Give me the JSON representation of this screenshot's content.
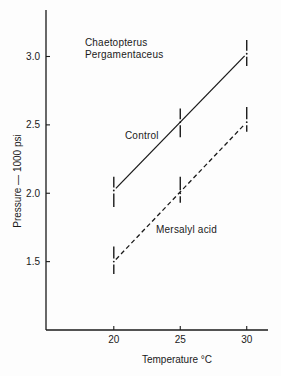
{
  "chart_data": {
    "type": "line",
    "title": "",
    "xlabel": "Temperature °C",
    "ylabel": "Pressure — 1000 psi",
    "x": [
      20,
      25,
      30
    ],
    "xticks": [
      20,
      25,
      30
    ],
    "xtick_labels": [
      "20",
      "25",
      "30"
    ],
    "yticks": [
      1.5,
      2.0,
      2.5,
      3.0
    ],
    "ytick_labels": [
      "1.5",
      "2.0",
      "2.5",
      "3.0"
    ],
    "xlim": [
      14.9,
      31.6
    ],
    "ylim": [
      1.0,
      3.34
    ],
    "grid": false,
    "legend": "none (series labeled directly on plot)",
    "series": [
      {
        "name": "Control",
        "line_style": "solid",
        "values": [
          2.02,
          2.52,
          3.02
        ],
        "error_low": [
          1.9,
          2.41,
          2.93
        ],
        "error_high": [
          2.12,
          2.62,
          3.12
        ]
      },
      {
        "name": "Mersalyl acid",
        "line_style": "dashed",
        "values": [
          1.5,
          2.0,
          2.52
        ],
        "error_low": [
          1.41,
          1.93,
          2.45
        ],
        "error_high": [
          1.61,
          2.12,
          2.63
        ]
      }
    ],
    "annotations": [
      {
        "text": "Chaetopterus",
        "x": 17.83,
        "y": 3.08
      },
      {
        "text": "Pergamentaceus",
        "x": 17.83,
        "y": 2.99
      },
      {
        "text": "Control",
        "x": 20.84,
        "y": 2.4
      },
      {
        "text": "Mersalyl acid",
        "x": 23.18,
        "y": 1.71
      }
    ]
  }
}
